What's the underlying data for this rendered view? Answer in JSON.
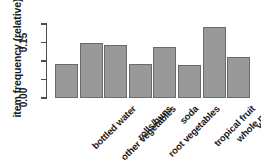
{
  "chart_data": {
    "type": "bar",
    "title": "",
    "xlabel": "",
    "ylabel": "item frequency (relative)",
    "categories": [
      "bottled water",
      "other vegetables",
      "rolls/buns",
      "root vegetables",
      "soda",
      "tropical fruit",
      "whole milk",
      "yogurt"
    ],
    "values": [
      0.092,
      0.149,
      0.143,
      0.138,
      0.111,
      0.089,
      0.192,
      0.111
    ],
    "ylim": [
      0.0,
      0.2
    ],
    "yticks": [
      0.0,
      0.05,
      0.1,
      0.15,
      0.2
    ],
    "ytick_labels": [
      "0.00",
      "",
      "",
      "0.15",
      ""
    ],
    "grid": false,
    "legend": null,
    "bar_fill_color": "#999999",
    "bar_border_color": "#6b6b6b",
    "axis_color": "#4d4d4d"
  },
  "bars": [
    {
      "label": "bottled water",
      "value": 0.092
    },
    {
      "label": "other vegetables",
      "value": 0.149
    },
    {
      "label": "rolls/buns",
      "value": 0.143
    },
    {
      "label": "root vegetables",
      "value": 0.092
    },
    {
      "label": "soda",
      "value": 0.138
    },
    {
      "label": "tropical fruit",
      "value": 0.089
    },
    {
      "label": "whole milk",
      "value": 0.192
    },
    {
      "label": "yogurt",
      "value": 0.111
    }
  ],
  "axis": {
    "ylabel": "item frequency (relative)",
    "ticks": [
      {
        "value": 0.15,
        "label": "0.15"
      },
      {
        "value": 0.0,
        "label": "0.00"
      }
    ]
  }
}
